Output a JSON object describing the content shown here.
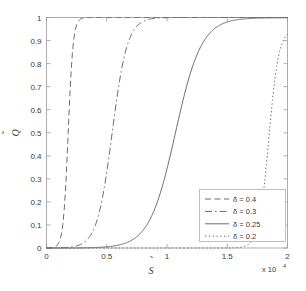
{
  "chart_data": {
    "type": "line",
    "title": "",
    "xlabel": "S̃",
    "ylabel": "Q̃",
    "x_multiplier": "x 10",
    "x_multiplier_exp": "4",
    "xlim": [
      0,
      2
    ],
    "ylim": [
      0,
      1
    ],
    "xticks": [
      "0",
      "0.5",
      "1",
      "1.5",
      "2"
    ],
    "xtick_values": [
      0,
      0.5,
      1,
      1.5,
      2
    ],
    "yticks": [
      "0",
      "0.1",
      "0.2",
      "0.3",
      "0.4",
      "0.5",
      "0.6",
      "0.7",
      "0.8",
      "0.9",
      "1"
    ],
    "ytick_values": [
      0,
      0.1,
      0.2,
      0.3,
      0.4,
      0.5,
      0.6,
      0.7,
      0.8,
      0.9,
      1
    ],
    "grid": false,
    "legend_position": "lower right",
    "series": [
      {
        "name": "δ = 0.4",
        "delta": 0.4,
        "style": "dashed",
        "color": "#6b6b6b",
        "midpoint_x": 0.18,
        "steepness": 22,
        "x": [
          0.0,
          0.05,
          0.1,
          0.12,
          0.14,
          0.16,
          0.18,
          0.2,
          0.22,
          0.25,
          0.28,
          0.32,
          0.36,
          0.4,
          0.5,
          0.7,
          1.0,
          1.5,
          2.0
        ],
        "y": [
          0.0,
          0.001,
          0.05,
          0.125,
          0.26,
          0.44,
          0.5,
          0.7,
          0.81,
          0.91,
          0.96,
          0.985,
          0.994,
          0.998,
          1.0,
          1.0,
          1.0,
          1.0,
          1.0
        ]
      },
      {
        "name": "δ = 0.3",
        "delta": 0.3,
        "style": "dashdot",
        "color": "#8a8a8a",
        "midpoint_x": 0.545,
        "steepness": 7.2,
        "x": [
          0.0,
          0.2,
          0.34,
          0.38,
          0.42,
          0.46,
          0.5,
          0.545,
          0.6,
          0.66,
          0.72,
          0.8,
          0.9,
          1.0,
          1.15,
          1.3,
          1.5,
          1.75,
          2.0
        ],
        "y": [
          0.0,
          0.0,
          0.01,
          0.035,
          0.09,
          0.22,
          0.38,
          0.5,
          0.65,
          0.78,
          0.87,
          0.94,
          0.978,
          0.992,
          0.998,
          0.999,
          1.0,
          1.0,
          1.0
        ]
      },
      {
        "name": "δ = 0.25",
        "delta": 0.25,
        "style": "solid",
        "color": "#6b6b6b",
        "midpoint_x": 1.07,
        "steepness": 4.2,
        "x": [
          0.0,
          0.4,
          0.65,
          0.72,
          0.8,
          0.88,
          0.95,
          1.0,
          1.07,
          1.15,
          1.22,
          1.3,
          1.4,
          1.5,
          1.6,
          1.72,
          1.85,
          1.95,
          2.0
        ],
        "y": [
          0.0,
          0.0,
          0.005,
          0.02,
          0.07,
          0.175,
          0.315,
          0.405,
          0.5,
          0.62,
          0.715,
          0.8,
          0.885,
          0.935,
          0.965,
          0.985,
          0.994,
          0.998,
          0.999
        ]
      },
      {
        "name": "δ = 0.2",
        "delta": 0.2,
        "style": "dotted",
        "color": "#c4c4c4",
        "midpoint_x": 1.845,
        "steepness": 11,
        "x": [
          0.0,
          1.0,
          1.45,
          1.55,
          1.62,
          1.68,
          1.74,
          1.8,
          1.845,
          1.88,
          1.91,
          1.94,
          1.96,
          1.98,
          2.0
        ],
        "y": [
          0.0,
          0.0,
          0.002,
          0.01,
          0.03,
          0.075,
          0.18,
          0.36,
          0.5,
          0.64,
          0.74,
          0.83,
          0.88,
          0.925,
          0.95
        ]
      }
    ],
    "legend_entries": [
      {
        "label": "δ = 0.4",
        "style": "dashed"
      },
      {
        "label": "δ = 0.3",
        "style": "dashdot"
      },
      {
        "label": "δ = 0.25",
        "style": "solid"
      },
      {
        "label": "δ = 0.2",
        "style": "dotted"
      }
    ]
  }
}
